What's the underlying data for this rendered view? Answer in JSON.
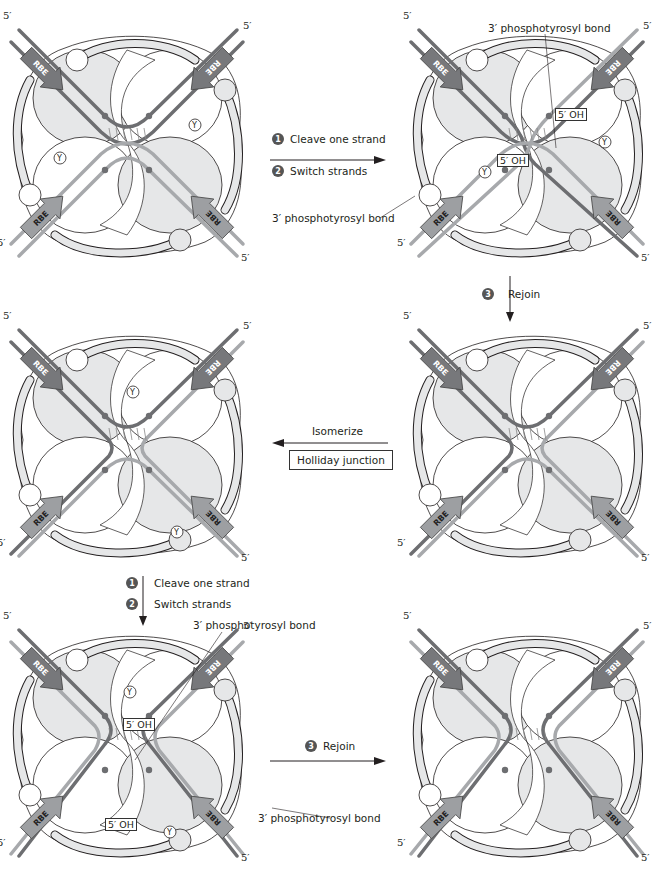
{
  "figure": {
    "panels": [
      {
        "id": "p1",
        "x": 5,
        "y": 20,
        "stage": "synaptic complex",
        "five_prime_labels": [
          "5′",
          "5′",
          "5′",
          "5′"
        ],
        "rbe_labels": [
          "RBE",
          "RBE",
          "RBE",
          "RBE"
        ],
        "tyrosine_label": "Y"
      },
      {
        "id": "p2",
        "x": 405,
        "y": 20,
        "stage": "after cleave and switch (first pair)",
        "five_prime_labels": [
          "5′",
          "5′",
          "5′",
          "5′"
        ],
        "rbe_labels": [
          "RBE",
          "RBE",
          "RBE",
          "RBE"
        ],
        "oh_labels": [
          "5′ OH",
          "5′ OH"
        ],
        "tyrosine_label": "Y"
      },
      {
        "id": "p3",
        "x": 405,
        "y": 320,
        "stage": "Holliday junction",
        "five_prime_labels": [
          "5′",
          "5′",
          "5′",
          "5′"
        ],
        "rbe_labels": [
          "RBE",
          "RBE",
          "RBE",
          "RBE"
        ]
      },
      {
        "id": "p4",
        "x": 5,
        "y": 320,
        "stage": "isomerized Holliday junction",
        "five_prime_labels": [
          "5′",
          "5′",
          "5′",
          "5′"
        ],
        "rbe_labels": [
          "RBE",
          "RBE",
          "RBE",
          "RBE"
        ],
        "tyrosine_label": "Y"
      },
      {
        "id": "p5",
        "x": 5,
        "y": 620,
        "stage": "after cleave and switch (second pair)",
        "five_prime_labels": [
          "5′",
          "5′",
          "5′",
          "5′"
        ],
        "rbe_labels": [
          "RBE",
          "RBE",
          "RBE",
          "RBE"
        ],
        "oh_labels": [
          "5′ OH",
          "5′ OH"
        ],
        "tyrosine_label": "Y"
      },
      {
        "id": "p6",
        "x": 405,
        "y": 620,
        "stage": "recombinant products",
        "five_prime_labels": [
          "5′",
          "5′",
          "5′",
          "5′"
        ],
        "rbe_labels": [
          "RBE",
          "RBE",
          "RBE",
          "RBE"
        ]
      }
    ],
    "steps": {
      "top": {
        "step1_num": "1",
        "step1": "Cleave one strand",
        "step2_num": "2",
        "step2": "Switch strands"
      },
      "right_down": {
        "step3_num": "3",
        "step3": "Rejoin"
      },
      "middle": {
        "label": "Isomerize",
        "box": "Holliday junction"
      },
      "left_down": {
        "step1_num": "1",
        "step1": "Cleave one strand",
        "step2_num": "2",
        "step2": "Switch strands"
      },
      "bottom": {
        "step3_num": "3",
        "step3": "Rejoin"
      }
    },
    "annotations": {
      "bond": "3′ phosphotyrosyl bond"
    },
    "colors": {
      "dark_strand": "#6d6e71",
      "light_strand": "#a7a9ac",
      "rbe_dark": "#77787b",
      "rbe_light": "#9d9fa2",
      "protein_fill": "#e6e7e8",
      "outline": "#231f20"
    }
  }
}
